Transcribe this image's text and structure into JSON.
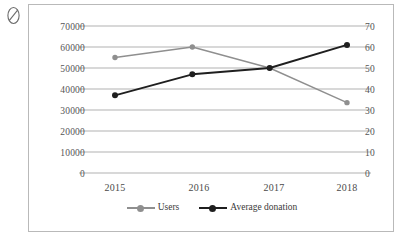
{
  "annotation": {
    "mark_name": "oval-slash-mark",
    "color": "#6b6b6b"
  },
  "frame": {
    "border_color": "#b9b9b9",
    "background": "#ffffff"
  },
  "chart_data": {
    "type": "line",
    "title": "",
    "subtitle": "",
    "xlabel": "",
    "ylabel": "",
    "categories": [
      "2015",
      "2016",
      "2017",
      "2018"
    ],
    "grid": true,
    "legend_position": "bottom",
    "axes": {
      "left": {
        "label": "",
        "ticks": [
          "0",
          "10000",
          "20000",
          "30000",
          "40000",
          "50000",
          "60000",
          "70000"
        ],
        "tick_values": [
          0,
          10000,
          20000,
          30000,
          40000,
          50000,
          60000,
          70000
        ],
        "ylim": [
          0,
          70000
        ]
      },
      "right": {
        "label": "",
        "ticks": [
          "0",
          "10",
          "20",
          "30",
          "40",
          "50",
          "60",
          "70"
        ],
        "tick_values": [
          0,
          10,
          20,
          30,
          40,
          50,
          60,
          70
        ],
        "ylim": [
          0,
          70
        ]
      }
    },
    "series": [
      {
        "name": "Users",
        "axis": "left",
        "color": "#8f8f8f",
        "marker": "circle",
        "values": [
          55000,
          60000,
          50000,
          33500
        ]
      },
      {
        "name": "Average donation",
        "axis": "right",
        "color": "#1f1f1f",
        "marker": "circle",
        "values": [
          37,
          47,
          50,
          61
        ]
      }
    ]
  }
}
